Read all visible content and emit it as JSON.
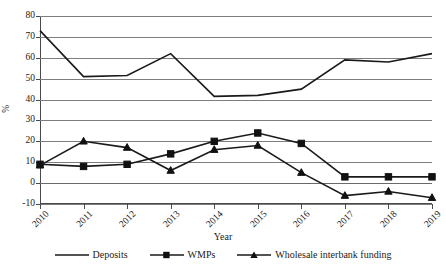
{
  "chart_data": {
    "type": "line",
    "title": "",
    "xlabel": "Year",
    "ylabel": "%",
    "categories": [
      "2010",
      "2011",
      "2012",
      "2013",
      "2014",
      "2015",
      "2016",
      "2017",
      "2018",
      "2019"
    ],
    "ylim": [
      -10,
      80
    ],
    "yticks": [
      -10,
      0,
      10,
      20,
      30,
      40,
      50,
      60,
      70,
      80
    ],
    "ytick_labels": [
      "-10",
      "0",
      "10",
      "20",
      "30",
      "40",
      "50",
      "60",
      "70",
      "80"
    ],
    "grid": true,
    "legend_position": "bottom",
    "series": [
      {
        "name": "Deposits",
        "marker": "none",
        "values": [
          73,
          51,
          51.5,
          62,
          41.5,
          42,
          45,
          59,
          58,
          62
        ]
      },
      {
        "name": "WMPs",
        "marker": "square",
        "values": [
          9,
          8,
          9,
          14,
          20,
          24,
          19,
          3,
          3,
          3
        ]
      },
      {
        "name": "Wholesale interbank funding",
        "marker": "triangle",
        "values": [
          8.5,
          20,
          17,
          6,
          16,
          18,
          5,
          -6,
          -4,
          -7
        ]
      }
    ]
  },
  "axes": {
    "y_title": "%",
    "x_title": "Year"
  },
  "legend": {
    "items": [
      {
        "label": "Deposits",
        "marker": "line-icon"
      },
      {
        "label": "WMPs",
        "marker": "square-marker-icon"
      },
      {
        "label": "Wholesale interbank funding",
        "marker": "triangle-marker-icon"
      }
    ]
  }
}
